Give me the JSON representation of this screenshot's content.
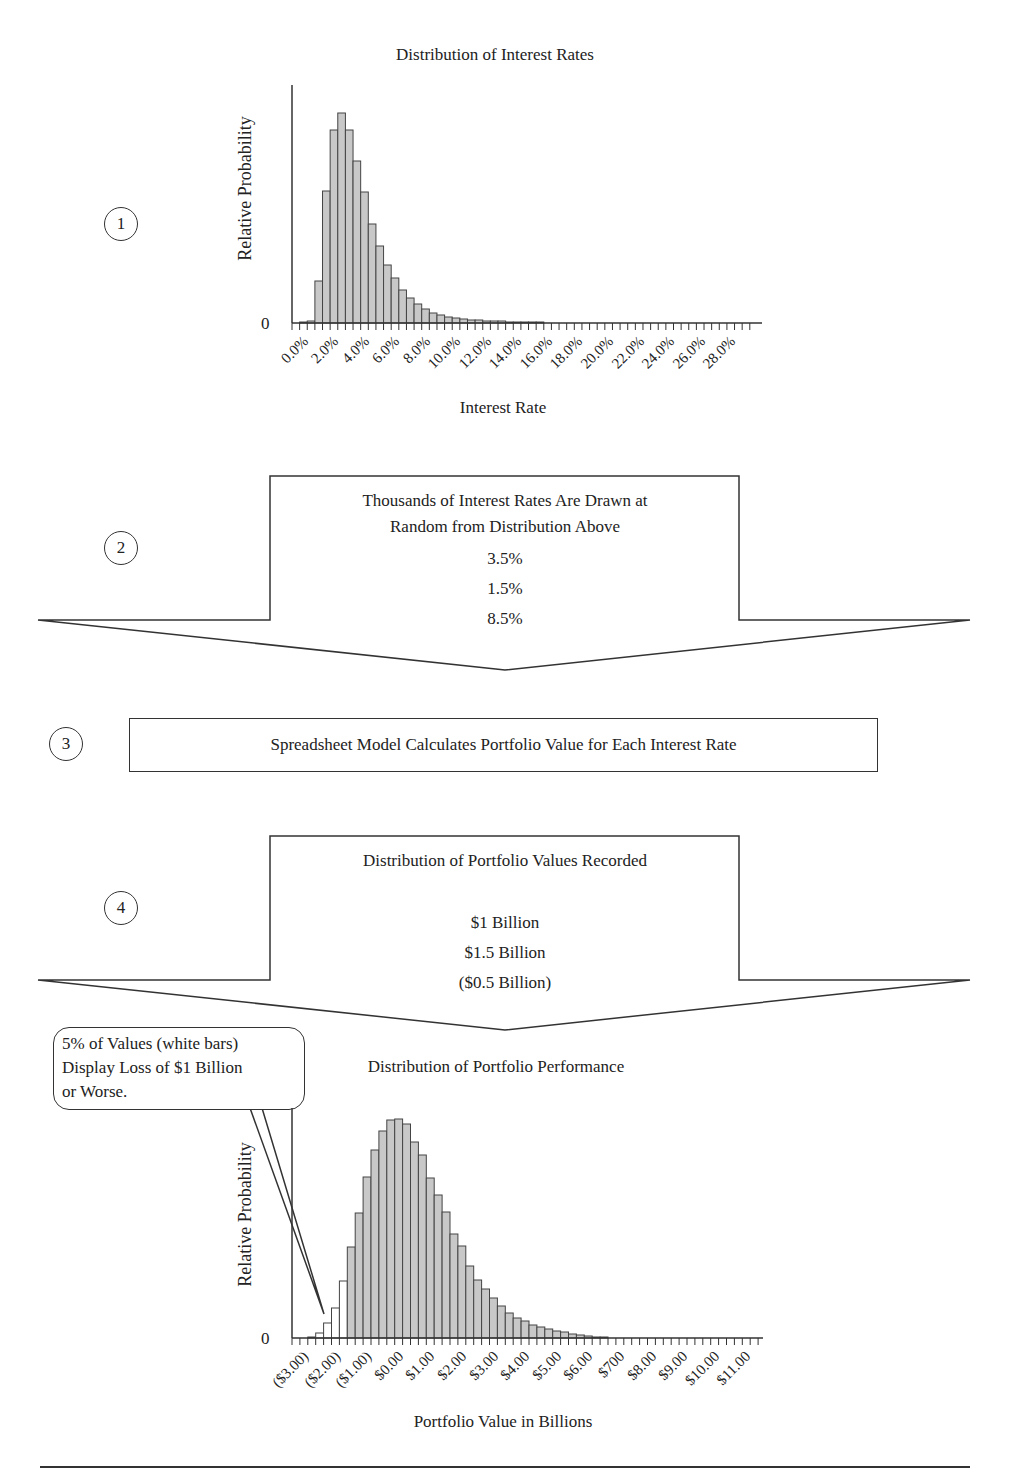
{
  "step1": {
    "number": "1",
    "chart_title": "Distribution of Interest Rates",
    "y_label": "Relative Probability",
    "y_zero": "0",
    "x_label": "Interest Rate",
    "x_ticks": [
      "0.0%",
      "2.0%",
      "4.0%",
      "6.0%",
      "8.0%",
      "10.0%",
      "12.0%",
      "14.0%",
      "16.0%",
      "18.0%",
      "20.0%",
      "22.0%",
      "24.0%",
      "26.0%",
      "28.0%"
    ]
  },
  "step2": {
    "number": "2",
    "line1": "Thousands of Interest Rates Are Drawn at",
    "line2": "Random from Distribution Above",
    "samples": [
      "3.5%",
      "1.5%",
      "8.5%"
    ]
  },
  "step3": {
    "number": "3",
    "text": "Spreadsheet Model Calculates Portfolio Value for Each Interest Rate"
  },
  "step4": {
    "number": "4",
    "line1": "Distribution of Portfolio Values Recorded",
    "samples": [
      "$1 Billion",
      "$1.5 Billion",
      "($0.5 Billion)"
    ]
  },
  "step5": {
    "callout": [
      "5% of Values (white bars)",
      "Display Loss of $1 Billion",
      "or Worse."
    ],
    "chart_title": "Distribution of Portfolio Performance",
    "y_label": "Relative Probability",
    "y_zero": "0",
    "x_label": "Portfolio Value in Billions",
    "x_ticks": [
      "($3.00)",
      "($2.00)",
      "($1.00)",
      "$0.00",
      "$1.00",
      "$2.00",
      "$3.00",
      "$4.00",
      "$5.00",
      "$6.00",
      "$700",
      "$8.00",
      "$9.00",
      "$10.00",
      "$11.00"
    ]
  },
  "colors": {
    "bar_fill": "#c8c8c8",
    "bar_stroke": "#444444",
    "white_bar": "#ffffff",
    "line": "#333333"
  },
  "chart_data": [
    {
      "type": "bar",
      "title": "Distribution of Interest Rates",
      "xlabel": "Interest Rate",
      "ylabel": "Relative Probability",
      "bin_width": "0.5%",
      "categories": [
        "0.0%",
        "0.5%",
        "1.0%",
        "1.5%",
        "2.0%",
        "2.5%",
        "3.0%",
        "3.5%",
        "4.0%",
        "4.5%",
        "5.0%",
        "5.5%",
        "6.0%",
        "6.5%",
        "7.0%",
        "7.5%",
        "8.0%",
        "8.5%",
        "9.0%",
        "9.5%",
        "10.0%",
        "10.5%",
        "11.0%",
        "11.5%",
        "12.0%",
        "12.5%",
        "13.0%",
        "13.5%",
        "14.0%",
        "14.5%",
        "15.0%",
        "15.5%",
        "16.0%",
        "16.5%"
      ],
      "values": [
        0,
        1,
        2,
        42,
        132,
        193,
        210,
        193,
        162,
        131,
        99,
        77,
        58,
        45,
        33,
        25,
        19,
        14,
        10,
        8,
        6,
        5,
        4,
        3,
        3,
        2,
        2,
        2,
        1,
        1,
        1,
        1,
        1,
        0
      ],
      "x_tick_labels": [
        "0.0%",
        "2.0%",
        "4.0%",
        "6.0%",
        "8.0%",
        "10.0%",
        "12.0%",
        "14.0%",
        "16.0%",
        "18.0%",
        "20.0%",
        "22.0%",
        "24.0%",
        "26.0%",
        "28.0%"
      ],
      "y_ticks": [
        "0"
      ],
      "grid": false
    },
    {
      "type": "bar",
      "title": "Distribution of Portfolio Performance",
      "xlabel": "Portfolio Value in Billions",
      "ylabel": "Relative Probability",
      "bin_width": "$0.25B",
      "values": [
        0,
        0,
        1,
        5,
        15,
        30,
        57,
        91,
        125,
        161,
        188,
        207,
        218,
        219,
        214,
        196,
        183,
        160,
        143,
        126,
        104,
        92,
        72,
        58,
        49,
        40,
        32,
        25,
        20,
        17,
        13,
        11,
        9,
        7,
        6,
        4,
        3,
        2,
        1,
        1
      ],
      "white_bar_indices": [
        2,
        3,
        4,
        5,
        6
      ],
      "annotation": "5% of Values (white bars) Display Loss of $1 Billion or Worse.",
      "x_tick_labels": [
        "($3.00)",
        "($2.00)",
        "($1.00)",
        "$0.00",
        "$1.00",
        "$2.00",
        "$3.00",
        "$4.00",
        "$5.00",
        "$6.00",
        "$700",
        "$8.00",
        "$9.00",
        "$10.00",
        "$11.00"
      ],
      "y_ticks": [
        "0"
      ],
      "grid": false
    }
  ]
}
